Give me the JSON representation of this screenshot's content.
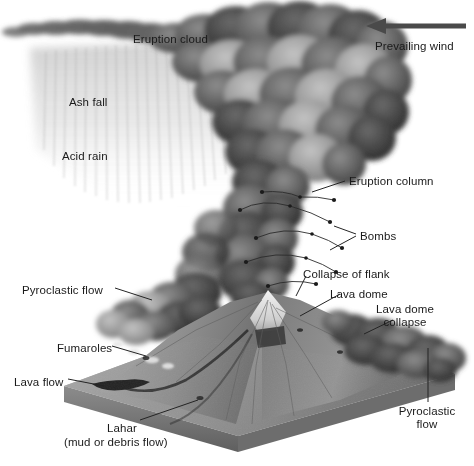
{
  "figure": {
    "style": "grayscale halftone illustration of an erupting stratovolcano on a square terrain block",
    "palette": {
      "background": "#ffffff",
      "label_text": "#1a1a1a",
      "leader_line": "#3a3a3a",
      "arrow": "#4a4a4a",
      "ash_cloud_dark": "#4b4b4b",
      "ash_cloud_mid": "#7d7d7d",
      "ash_cloud_light": "#b4b4b4",
      "ash_fall_veil": "#dcdcdc",
      "terrain_light": "#c9c9c9",
      "terrain_mid": "#9a9a9a",
      "terrain_dark": "#6b6b6b",
      "base_slab_top": "#9e9e9e",
      "base_slab_side": "#747474",
      "summit_snow": "#ededed",
      "lava_dark": "#2e2e2e"
    }
  },
  "labels": [
    {
      "id": "eruption-cloud",
      "text": "Eruption cloud",
      "x": 133,
      "y": 33,
      "align": "left",
      "leader": false
    },
    {
      "id": "prevailing-wind",
      "text": "Prevailing wind",
      "x": 375,
      "y": 40,
      "align": "left",
      "leader": false
    },
    {
      "id": "ash-fall",
      "text": "Ash fall",
      "x": 69,
      "y": 96,
      "align": "left",
      "leader": false
    },
    {
      "id": "acid-rain",
      "text": "Acid rain",
      "x": 62,
      "y": 150,
      "align": "left",
      "leader": false
    },
    {
      "id": "eruption-column",
      "text": "Eruption column",
      "x": 349,
      "y": 175,
      "align": "left",
      "leader": true
    },
    {
      "id": "bombs",
      "text": "Bombs",
      "x": 360,
      "y": 230,
      "align": "left",
      "leader": true
    },
    {
      "id": "pyroclastic-flow-left",
      "text": "Pyroclastic flow",
      "x": 22,
      "y": 284,
      "align": "left",
      "leader": true
    },
    {
      "id": "collapse-of-flank",
      "text": "Collapse of flank",
      "x": 303,
      "y": 268,
      "align": "left",
      "leader": true
    },
    {
      "id": "lava-dome",
      "text": "Lava dome",
      "x": 330,
      "y": 288,
      "align": "left",
      "leader": true
    },
    {
      "id": "lava-dome-collapse",
      "text": "Lava dome\ncollapse",
      "x": 405,
      "y": 303,
      "align": "center",
      "leader": true
    },
    {
      "id": "fumaroles",
      "text": "Fumaroles",
      "x": 57,
      "y": 342,
      "align": "left",
      "leader": true
    },
    {
      "id": "lava-flow",
      "text": "Lava flow",
      "x": 14,
      "y": 376,
      "align": "left",
      "leader": true
    },
    {
      "id": "lahar",
      "text": "Lahar",
      "x": 107,
      "y": 422,
      "align": "left",
      "leader": true
    },
    {
      "id": "lahar-sub",
      "text": "(mud or debris flow)",
      "x": 64,
      "y": 436,
      "align": "left",
      "leader": false
    },
    {
      "id": "pyroclastic-flow-right",
      "text": "Pyroclastic\nflow",
      "x": 427,
      "y": 412,
      "align": "center",
      "leader": true
    }
  ],
  "wind_arrow": {
    "direction": "left",
    "tail_x": 466,
    "head_x": 366,
    "y": 26
  },
  "features": [
    "eruption cloud spreading downwind to the left",
    "ash fall streaks beneath the cloud",
    "acid rain veil",
    "vertical eruption column above the vent",
    "ballistic bombs with arcing trajectories",
    "pyroclastic flow descending left flank",
    "lava dome at the summit",
    "lava dome collapse on the right flank",
    "fumaroles on the lower left slope",
    "lava flow reaching the base",
    "lahar channel across the terrain block",
    "pyroclastic flow on the right flank"
  ]
}
